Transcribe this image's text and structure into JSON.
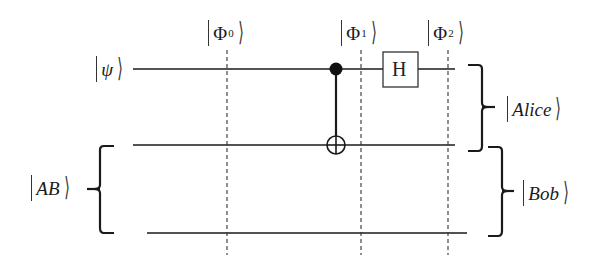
{
  "diagram": {
    "type": "quantum-circuit",
    "input_labels": {
      "psi": "ψ",
      "ab": "AB"
    },
    "state_labels": [
      {
        "symbol": "Φ",
        "sub": "0"
      },
      {
        "symbol": "Φ",
        "sub": "1"
      },
      {
        "symbol": "Φ",
        "sub": "2"
      }
    ],
    "gates": {
      "hadamard": "H"
    },
    "output_labels": {
      "alice": "Alice",
      "bob": "Bob"
    },
    "colors": {
      "line": "#1a1a1a",
      "background": "#ffffff"
    }
  }
}
